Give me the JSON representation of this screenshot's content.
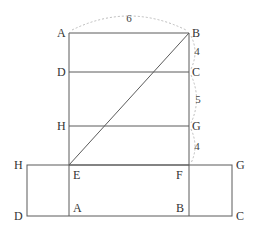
{
  "diagram": {
    "upper_figure": {
      "labels": {
        "A": "A",
        "B": "B",
        "D": "D",
        "C": "C",
        "H": "H",
        "G": "G",
        "E": "E",
        "F": "F"
      },
      "dimensions": {
        "AB": "6",
        "BC": "4",
        "CG": "5",
        "GF": "4"
      }
    },
    "lower_figure": {
      "labels": {
        "H": "H",
        "G": "G",
        "D": "D",
        "C": "C",
        "A": "A",
        "B": "B"
      }
    },
    "colors": {
      "line": "#5a5a5a",
      "dashed_arc": "#bdbdbd",
      "text": "#333333"
    }
  }
}
